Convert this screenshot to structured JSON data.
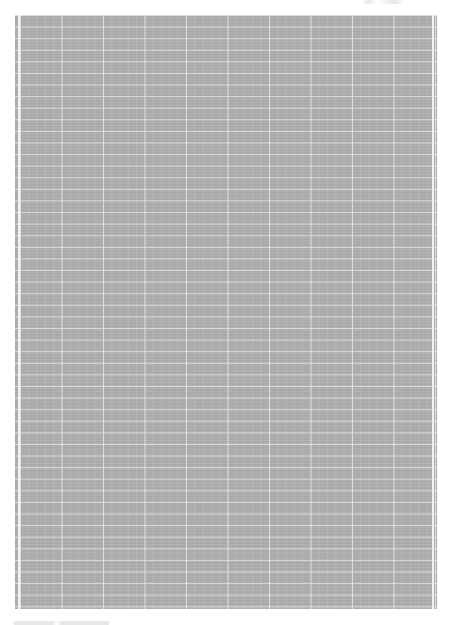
{
  "document": {
    "type": "grid-paper-scan",
    "colors": {
      "background": "#ffffff",
      "grid_fill": "#a9a9a9",
      "grid_lines": "#ebebeb"
    },
    "grid": {
      "major_columns": 10,
      "major_row_spacing_px": 11.6
    },
    "header_text": "",
    "footer_text": ""
  }
}
